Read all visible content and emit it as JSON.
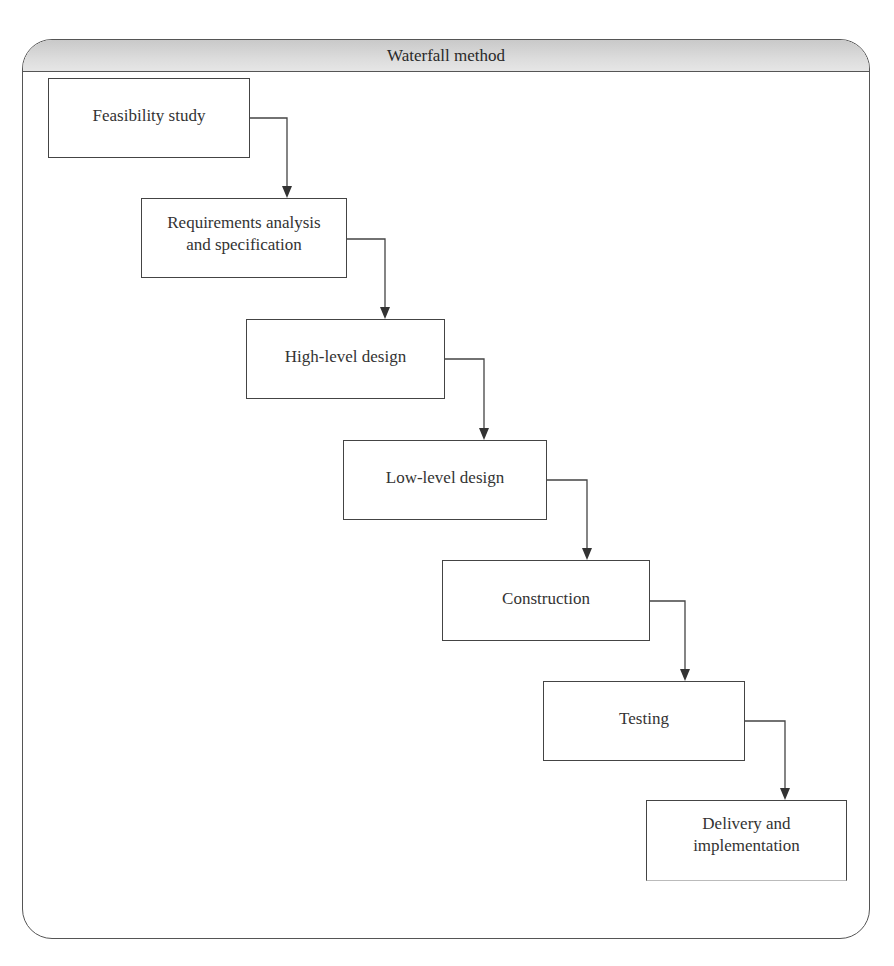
{
  "diagram": {
    "title": "Waterfall method",
    "steps": [
      {
        "label": "Feasibility study"
      },
      {
        "label": "Requirements analysis\nand specification"
      },
      {
        "label": "High-level design"
      },
      {
        "label": "Low-level design"
      },
      {
        "label": "Construction"
      },
      {
        "label": "Testing"
      },
      {
        "label": "Delivery and\nimplementation"
      }
    ],
    "connectors": [
      {
        "from": "Feasibility study",
        "to": "Requirements analysis and specification"
      },
      {
        "from": "Requirements analysis and specification",
        "to": "High-level design"
      },
      {
        "from": "High-level design",
        "to": "Low-level design"
      },
      {
        "from": "Low-level design",
        "to": "Construction"
      },
      {
        "from": "Construction",
        "to": "Testing"
      },
      {
        "from": "Testing",
        "to": "Delivery and implementation"
      }
    ],
    "colors": {
      "border": "#444444",
      "header_fill": "#d4d4d4",
      "text": "#333333"
    }
  }
}
